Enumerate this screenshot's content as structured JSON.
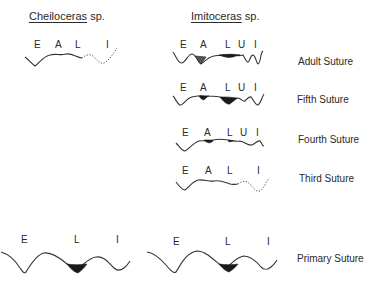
{
  "left_column": {
    "title_genus": "Cheiloceras",
    "title_suffix": " sp.",
    "juvenile_lobes": [
      "E",
      "A",
      "L",
      "I"
    ],
    "primary_lobes": [
      "E",
      "L",
      "I"
    ]
  },
  "right_column": {
    "title_genus": "Imitoceras",
    "title_suffix": " sp.",
    "sutures": [
      {
        "caption": "Adult Suture",
        "lobes": [
          "E",
          "A",
          "L",
          "U",
          "I"
        ]
      },
      {
        "caption": "Fifth Suture",
        "lobes": [
          "E",
          "A",
          "L",
          "U",
          "I"
        ]
      },
      {
        "caption": "Fourth Suture",
        "lobes": [
          "E",
          "A",
          "L",
          "U",
          "I"
        ]
      },
      {
        "caption": "Third Suture",
        "lobes": [
          "E",
          "A",
          "L",
          "I"
        ]
      }
    ],
    "primary_lobes": [
      "E",
      "L",
      "I"
    ]
  },
  "primary_caption": "Primary Suture",
  "colors": {
    "ink": "#2a2a2a",
    "fill": "#1a1a1a",
    "background": "#ffffff"
  }
}
